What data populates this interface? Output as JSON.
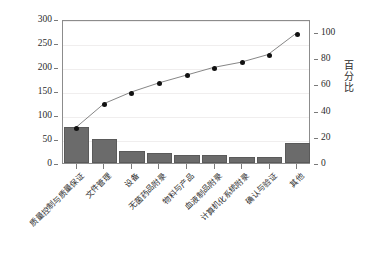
{
  "chart_data": {
    "type": "bar",
    "title": "",
    "subtitle": "",
    "xlabel": "",
    "ylabel": "",
    "ylabel_right": "百分比",
    "grid": true,
    "legend": "none",
    "categories": [
      "质量控制与质量保证",
      "文件管理",
      "设备",
      "无菌药品附录",
      "物料与产品",
      "血液制品附录",
      "计算机化系统附录",
      "确认与验证",
      "其他"
    ],
    "values": [
      75,
      50,
      26,
      20,
      17,
      16,
      12,
      12,
      42
    ],
    "ylim": [
      0,
      300
    ],
    "yticks": [
      0,
      50,
      100,
      150,
      200,
      250,
      300
    ],
    "ylim_right": [
      0,
      110
    ],
    "yticks_right": [
      0,
      20,
      40,
      60,
      80,
      100
    ],
    "series": [
      {
        "name": "累计百分比",
        "type": "line",
        "axis": "right",
        "values": [
          28,
          46,
          55,
          62,
          68,
          74,
          78,
          84,
          100
        ]
      }
    ],
    "colors": {
      "bar": "#6b6b6b",
      "bar_edge": "#5a5a5a",
      "line": "#777777",
      "marker": "#111111",
      "axis": "#8c8c8c",
      "grid": "#f0eeee",
      "text": "#2b2b2b",
      "background": "#ffffff"
    }
  }
}
